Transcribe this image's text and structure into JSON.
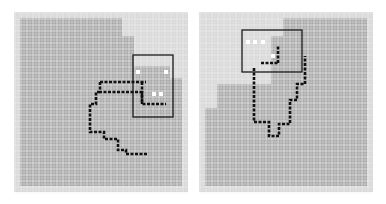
{
  "figure": {
    "colors": {
      "background": "#ffffff",
      "grid_fill": "#a8a8a8",
      "grid_light": "#d8d8d8",
      "grid_line": "#f4f4f4",
      "path": "#111111",
      "box": "#1a1a1a"
    },
    "cell": 6,
    "panels": [
      {
        "id": "left",
        "cols": 29,
        "rows": 30,
        "light_regions": [
          [
            0,
            0,
            29,
            1
          ],
          [
            0,
            29,
            29,
            1
          ],
          [
            0,
            0,
            1,
            30
          ],
          [
            28,
            0,
            1,
            30
          ],
          [
            18,
            0,
            11,
            4
          ],
          [
            20,
            4,
            9,
            5
          ],
          [
            26,
            9,
            3,
            2
          ]
        ],
        "box": {
          "x": 119,
          "y": 43,
          "w": 40,
          "h": 62
        },
        "paths": [
          [
            [
              128,
              70
            ],
            [
              128,
              92
            ],
            [
              152,
              92
            ]
          ],
          [
            [
              86,
              70
            ],
            [
              132,
              70
            ]
          ],
          [
            [
              86,
              70
            ],
            [
              86,
              80
            ],
            [
              128,
              80
            ],
            [
              128,
              92
            ]
          ],
          [
            [
              86,
              80
            ],
            [
              82,
              80
            ],
            [
              82,
              92
            ],
            [
              76,
              92
            ],
            [
              76,
              120
            ],
            [
              90,
              120
            ],
            [
              90,
              127
            ],
            [
              104,
              127
            ],
            [
              104,
              138
            ],
            [
              112,
              138
            ],
            [
              112,
              142
            ],
            [
              134,
              142
            ]
          ]
        ],
        "white_dots": [
          [
            122,
            58
          ],
          [
            150,
            58
          ],
          [
            138,
            80
          ],
          [
            145,
            80
          ]
        ]
      },
      {
        "id": "right",
        "cols": 29,
        "rows": 30,
        "light_regions": [
          [
            0,
            0,
            29,
            1
          ],
          [
            0,
            29,
            29,
            1
          ],
          [
            0,
            0,
            1,
            30
          ],
          [
            28,
            0,
            1,
            30
          ],
          [
            0,
            0,
            14,
            4
          ],
          [
            0,
            4,
            12,
            8
          ],
          [
            0,
            12,
            3,
            4
          ]
        ],
        "box": {
          "x": 43,
          "y": 18,
          "w": 60,
          "h": 42
        },
        "paths": [
          [
            [
              62,
              51
            ],
            [
              79,
              51
            ]
          ],
          [
            [
              79,
              51
            ],
            [
              79,
              33
            ]
          ],
          [
            [
              55,
              56
            ],
            [
              55,
              110
            ],
            [
              70,
              110
            ],
            [
              70,
              124
            ],
            [
              80,
              124
            ],
            [
              80,
              112
            ],
            [
              91,
              112
            ],
            [
              91,
              88
            ],
            [
              98,
              88
            ],
            [
              98,
              72
            ],
            [
              106,
              72
            ],
            [
              106,
              44
            ]
          ]
        ],
        "white_dots": [
          [
            47,
            28
          ],
          [
            54,
            28
          ],
          [
            62,
            28
          ],
          [
            72,
            42
          ]
        ]
      }
    ]
  }
}
